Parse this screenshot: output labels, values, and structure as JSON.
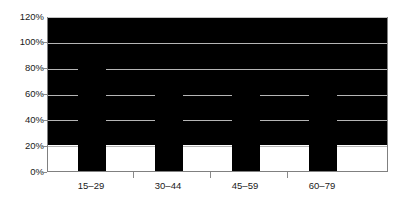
{
  "chart_data": {
    "type": "bar",
    "title": "",
    "subtitle": "",
    "xlabel": "",
    "ylabel": "",
    "categories": [
      "15–29",
      "30–44",
      "45–59",
      "60–79"
    ],
    "values": [
      100,
      92,
      74,
      67
    ],
    "value_labels": [
      "100%",
      "92%",
      "74%",
      "67%"
    ],
    "series": [
      {
        "name": "",
        "values": [
          100,
          92,
          74,
          67
        ]
      }
    ],
    "ylim": [
      0,
      120
    ],
    "ytick_step": 20,
    "ytick_labels": [
      "0%",
      "20%",
      "40%",
      "60%",
      "80%",
      "100%",
      "120%"
    ],
    "ytick_values": [
      0,
      20,
      40,
      60,
      80,
      100,
      120
    ],
    "grid": true,
    "grid_axis": "y",
    "legend": false,
    "legend_position": "none",
    "annotations": [],
    "colors": {
      "bar": "#000000",
      "gridline": "#b5b5b5",
      "axis": "#808080",
      "text": "#1a1a1a",
      "background": "#ffffff"
    }
  }
}
